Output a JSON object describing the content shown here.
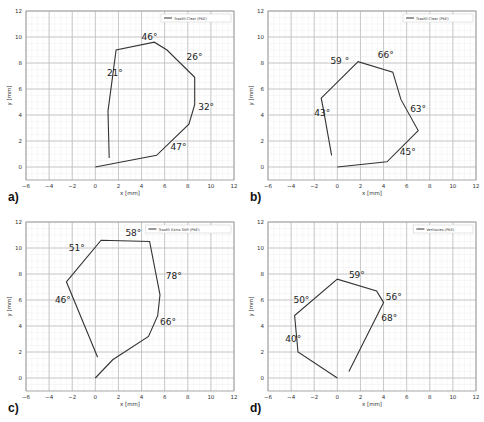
{
  "chart_data": [
    {
      "panel": "a)",
      "type": "line",
      "legend": "Trasfill Clear (PKE)",
      "xlabel": "x [mm]",
      "ylabel": "y [mm]",
      "xlim": [
        -6,
        12
      ],
      "ylim": [
        -1,
        12
      ],
      "xticks": [
        -6,
        -4,
        -2,
        0,
        2,
        4,
        6,
        8,
        10,
        12
      ],
      "yticks": [
        0,
        2,
        4,
        6,
        8,
        10,
        12
      ],
      "grid": true,
      "path": [
        [
          0,
          0
        ],
        [
          5.3,
          0.9
        ],
        [
          8.1,
          3.3
        ],
        [
          8.6,
          4.8
        ],
        [
          8.6,
          6.9
        ],
        [
          6.2,
          9.0
        ],
        [
          5.1,
          9.6
        ],
        [
          1.8,
          9.0
        ],
        [
          1.1,
          4.3
        ],
        [
          1.2,
          0.7
        ]
      ],
      "angles": [
        {
          "label": "46°",
          "x": 4.0,
          "y": 9.8
        },
        {
          "label": "26°",
          "x": 7.9,
          "y": 8.2
        },
        {
          "label": "21°",
          "x": 1.0,
          "y": 7.0
        },
        {
          "label": "32°",
          "x": 8.9,
          "y": 4.4
        },
        {
          "label": "47°",
          "x": 6.5,
          "y": 1.3
        }
      ]
    },
    {
      "panel": "b)",
      "type": "line",
      "legend": "Trasfill Clear (PKE)",
      "xlabel": "x [mm]",
      "ylabel": "y [mm]",
      "xlim": [
        -6,
        12
      ],
      "ylim": [
        -1,
        12
      ],
      "xticks": [
        -6,
        -4,
        -2,
        0,
        2,
        4,
        6,
        8,
        10,
        12
      ],
      "yticks": [
        0,
        2,
        4,
        6,
        8,
        10,
        12
      ],
      "grid": true,
      "path": [
        [
          0,
          0
        ],
        [
          4.3,
          0.4
        ],
        [
          7.0,
          2.8
        ],
        [
          5.5,
          5.2
        ],
        [
          4.8,
          7.3
        ],
        [
          1.8,
          8.1
        ],
        [
          -1.4,
          5.3
        ],
        [
          -1.2,
          4.4
        ],
        [
          -0.5,
          0.9
        ]
      ],
      "angles": [
        {
          "label": "59 °",
          "x": -0.6,
          "y": 7.9
        },
        {
          "label": "66°",
          "x": 3.5,
          "y": 8.4
        },
        {
          "label": "43°",
          "x": -2.0,
          "y": 3.9
        },
        {
          "label": "63°",
          "x": 6.3,
          "y": 4.2
        },
        {
          "label": "45°",
          "x": 5.4,
          "y": 0.9
        }
      ]
    },
    {
      "panel": "c)",
      "type": "line",
      "legend": "Trasfill Extra Stiff (PKE)",
      "xlabel": "x [mm]",
      "ylabel": "y [mm]",
      "xlim": [
        -6,
        12
      ],
      "ylim": [
        -1,
        12
      ],
      "xticks": [
        -6,
        -4,
        -2,
        0,
        2,
        4,
        6,
        8,
        10,
        12
      ],
      "yticks": [
        0,
        2,
        4,
        6,
        8,
        10,
        12
      ],
      "grid": true,
      "path": [
        [
          0,
          0
        ],
        [
          1.5,
          1.4
        ],
        [
          4.6,
          3.2
        ],
        [
          5.4,
          4.8
        ],
        [
          5.6,
          6.4
        ],
        [
          4.7,
          10.5
        ],
        [
          0.5,
          10.6
        ],
        [
          -2.5,
          7.4
        ],
        [
          0.2,
          1.6
        ]
      ],
      "angles": [
        {
          "label": "51°",
          "x": -2.3,
          "y": 9.8
        },
        {
          "label": "58°",
          "x": 2.6,
          "y": 10.9
        },
        {
          "label": "78°",
          "x": 6.1,
          "y": 7.6
        },
        {
          "label": "46°",
          "x": -3.5,
          "y": 5.8
        },
        {
          "label": "66°",
          "x": 5.6,
          "y": 4.1
        }
      ]
    },
    {
      "panel": "d)",
      "type": "line",
      "legend": "Vertiscies (PKE)",
      "xlabel": "x [mm]",
      "ylabel": "y [mm]",
      "xlim": [
        -6,
        12
      ],
      "ylim": [
        -1,
        12
      ],
      "xticks": [
        -6,
        -4,
        -2,
        0,
        2,
        4,
        6,
        8,
        10,
        12
      ],
      "yticks": [
        0,
        2,
        4,
        6,
        8,
        10,
        12
      ],
      "grid": true,
      "path": [
        [
          0,
          0
        ],
        [
          -3.4,
          2.0
        ],
        [
          -3.7,
          4.8
        ],
        [
          0,
          7.6
        ],
        [
          3.4,
          6.7
        ],
        [
          4.0,
          5.8
        ],
        [
          1.0,
          0.5
        ]
      ],
      "angles": [
        {
          "label": "59°",
          "x": 1.0,
          "y": 7.7
        },
        {
          "label": "50°",
          "x": -3.8,
          "y": 5.8
        },
        {
          "label": "56°",
          "x": 4.2,
          "y": 6.0
        },
        {
          "label": "68°",
          "x": 3.8,
          "y": 4.4
        },
        {
          "label": "40°",
          "x": -4.5,
          "y": 2.8
        }
      ]
    }
  ]
}
